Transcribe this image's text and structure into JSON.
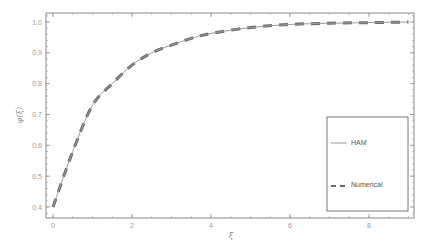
{
  "chart_data": {
    "type": "line",
    "title": "",
    "xlabel": "ξ",
    "ylabel": "φ(ξ)",
    "xlim": [
      -0.15,
      9.15
    ],
    "ylim": [
      0.37,
      1.03
    ],
    "x_ticks": [
      0,
      2,
      4,
      6,
      8
    ],
    "x_tick_labels": [
      "0",
      "2",
      "4",
      "6",
      "8"
    ],
    "y_ticks": [
      0.4,
      0.5,
      0.6,
      0.7,
      0.8,
      0.9,
      1.0
    ],
    "y_tick_labels": [
      "0.4",
      "0.5",
      "0.6",
      "0.7",
      "0.8",
      "0.9",
      "1.0"
    ],
    "grid": false,
    "legend_position": "lower right",
    "x": [
      0,
      0.5,
      1,
      1.5,
      2,
      2.5,
      3,
      3.5,
      4,
      5,
      6,
      7,
      8,
      9
    ],
    "series": [
      {
        "name": "HAM",
        "style": "solid",
        "color": "#9a9a9a",
        "values": [
          0.4,
          0.58,
          0.73,
          0.8,
          0.86,
          0.9,
          0.925,
          0.947,
          0.963,
          0.982,
          0.992,
          0.996,
          0.998,
          1.0
        ]
      },
      {
        "name": "Numerical",
        "style": "dashed",
        "color": "#6a6a6a",
        "values": [
          0.4,
          0.58,
          0.73,
          0.8,
          0.86,
          0.9,
          0.925,
          0.947,
          0.963,
          0.982,
          0.992,
          0.996,
          0.998,
          1.0
        ]
      }
    ]
  },
  "legend": {
    "items": [
      {
        "label": "HAM"
      },
      {
        "label": "Numerical"
      }
    ]
  }
}
